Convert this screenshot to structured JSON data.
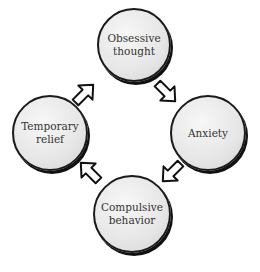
{
  "diagram": {
    "type": "cycle",
    "nodes": [
      {
        "id": "obsessive",
        "lines": [
          "Obsessive",
          "thought"
        ]
      },
      {
        "id": "anxiety",
        "lines": [
          "Anxiety"
        ]
      },
      {
        "id": "compulsive",
        "lines": [
          "Compulsive",
          "behavior"
        ]
      },
      {
        "id": "relief",
        "lines": [
          "Temporary",
          "relief"
        ]
      }
    ],
    "edges": [
      {
        "from": "obsessive",
        "to": "anxiety"
      },
      {
        "from": "anxiety",
        "to": "compulsive"
      },
      {
        "from": "compulsive",
        "to": "relief"
      },
      {
        "from": "relief",
        "to": "obsessive"
      }
    ],
    "colors": {
      "circle_fill": "#e6e6e6",
      "outline": "#1a1a1a",
      "text": "#333333"
    }
  }
}
